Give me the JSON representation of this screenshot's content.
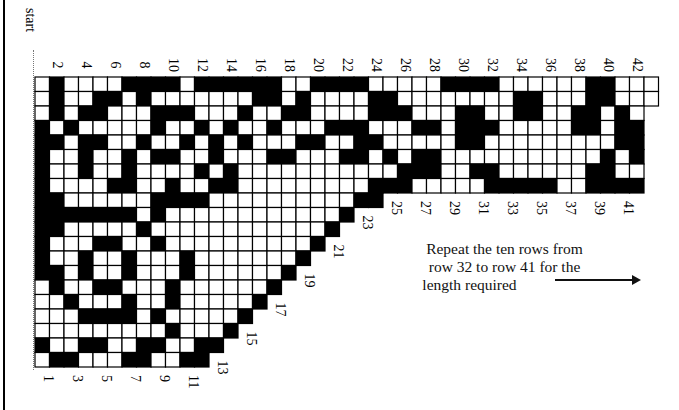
{
  "diagram": {
    "start_label": "start",
    "note_lines": [
      "Repeat the ten rows from",
      "row 32 to row 41 for the",
      "length required"
    ],
    "arrow_icon": "right-arrow",
    "colors": {
      "filled": "#000000",
      "empty": "#ffffff",
      "line": "#000000"
    },
    "top_labels": [
      "2",
      "4",
      "6",
      "8",
      "10",
      "12",
      "14",
      "16",
      "18",
      "20",
      "22",
      "24",
      "26",
      "28",
      "30",
      "32",
      "34",
      "36",
      "38",
      "40",
      "42"
    ],
    "bottom_labels": [
      "1",
      "3",
      "5",
      "7",
      "9",
      "11",
      "13",
      "15",
      "17",
      "19",
      "21",
      "23",
      "25",
      "27",
      "29",
      "31",
      "33",
      "35",
      "37",
      "39",
      "41"
    ],
    "grid_rows": [
      ".#....####.######..####.....####......##...",
      ".#..##.#.......##.#....##........##...##...",
      ".#.##...###...#..##....###...##..##..##.#.",
      "#.#.....#..#.#..#...###...##.###.....##.##",
      "##.##..#..#.#.#...##..##.....##.........##",
      "#..#..#.##..#...##...##.#.##...........#.#",
      "#..#..#....#.#...........###..##......##..",
      "#....##..#..##.........###.....#####..####",
      "##......####..........##                  ",
      "#######.#............#                    ",
      "##.....#............#                     ",
      "#...##..#..........#                      ",
      "#..#..#...#.......#                       ",
      "##.#..#...#......#                        ",
      ".#..##...#......#                         ",
      "..#...#..#.....#                          ",
      "...####.#.....#                           ",
      ".........#...#                            ",
      "#..##..##..##                             ",
      ".##...##..##                              "
    ]
  }
}
